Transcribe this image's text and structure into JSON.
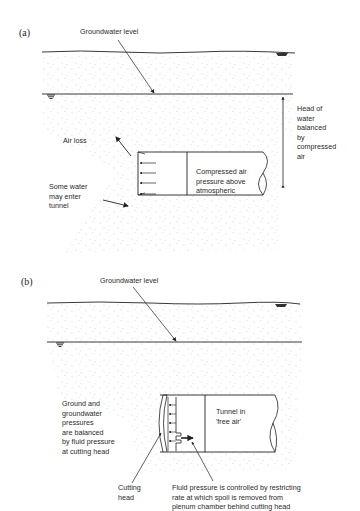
{
  "figure": {
    "panels": [
      {
        "id": "a",
        "label": "(a)",
        "groundwater_label": "Groundwater level",
        "head_label": "Head of\nwater\nbalanced\nby\ncompressed\nair",
        "air_loss_label": "Air loss",
        "water_enter_label": "Some water\nmay enter\ntunnel",
        "tunnel_label": "Compressed air\npressure above\natmospheric"
      },
      {
        "id": "b",
        "label": "(b)",
        "groundwater_label": "Groundwater level",
        "balance_label": "Ground and\ngroundwater\npressures\nare balanced\nby fluid pressure\nat cutting head",
        "tunnel_label": "Tunnel in\n'free air'",
        "cutting_head_label": "Cutting\nhead",
        "fluid_pressure_label": "Fluid pressure is controlled by restricting\nrate at which spoil is removed from\nplenum chamber behind cutting head"
      }
    ],
    "colors": {
      "line": "#222222",
      "stipple": "#9a9a9a",
      "background": "#ffffff"
    }
  }
}
